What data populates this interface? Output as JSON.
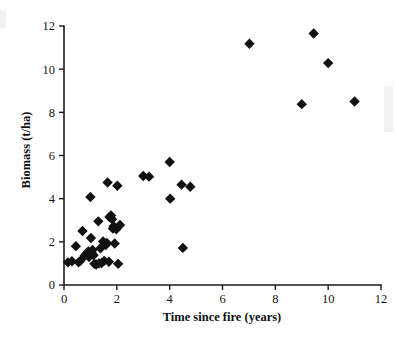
{
  "chart_data": {
    "type": "scatter",
    "title": "",
    "xlabel": "Time since fire (years)",
    "ylabel": "Biomass (t/ha)",
    "xlim": [
      0,
      12
    ],
    "ylim": [
      0,
      12
    ],
    "xticks": [
      0,
      2,
      4,
      6,
      8,
      10,
      12
    ],
    "yticks": [
      0,
      2,
      4,
      6,
      8,
      10,
      12
    ],
    "xtick_labels": [
      "0",
      "2",
      "4",
      "6",
      "8",
      "10",
      "12"
    ],
    "ytick_labels": [
      "0",
      "2",
      "4",
      "6",
      "8",
      "10",
      "12"
    ],
    "grid": false,
    "legend": false,
    "marker": "diamond",
    "marker_color": "#111111",
    "marker_size": 5.2,
    "series": [
      {
        "name": "Biomass vs time since fire",
        "points": [
          [
            0.15,
            1.05
          ],
          [
            0.3,
            1.1
          ],
          [
            0.45,
            1.8
          ],
          [
            0.55,
            1.05
          ],
          [
            0.62,
            1.12
          ],
          [
            0.7,
            2.5
          ],
          [
            0.78,
            1.35
          ],
          [
            0.85,
            1.45
          ],
          [
            0.92,
            1.55
          ],
          [
            0.95,
            1.3
          ],
          [
            1.0,
            4.08
          ],
          [
            1.02,
            2.18
          ],
          [
            1.05,
            1.48
          ],
          [
            1.08,
            1.62
          ],
          [
            1.12,
            1.38
          ],
          [
            1.15,
            0.98
          ],
          [
            1.22,
            0.95
          ],
          [
            1.3,
            2.95
          ],
          [
            1.32,
            1.0
          ],
          [
            1.38,
            1.7
          ],
          [
            1.42,
            1.02
          ],
          [
            1.48,
            2.02
          ],
          [
            1.52,
            1.12
          ],
          [
            1.58,
            1.85
          ],
          [
            1.62,
            1.95
          ],
          [
            1.65,
            4.75
          ],
          [
            1.7,
            1.08
          ],
          [
            1.72,
            3.15
          ],
          [
            1.78,
            3.22
          ],
          [
            1.82,
            3.05
          ],
          [
            1.85,
            2.62
          ],
          [
            1.88,
            2.72
          ],
          [
            1.92,
            1.92
          ],
          [
            1.98,
            2.58
          ],
          [
            2.02,
            4.6
          ],
          [
            2.05,
            0.98
          ],
          [
            2.12,
            2.78
          ],
          [
            3.0,
            5.05
          ],
          [
            3.22,
            5.02
          ],
          [
            4.0,
            5.7
          ],
          [
            4.02,
            4.0
          ],
          [
            4.45,
            4.65
          ],
          [
            4.5,
            1.72
          ],
          [
            4.78,
            4.55
          ],
          [
            7.02,
            11.18
          ],
          [
            9.0,
            8.38
          ],
          [
            9.45,
            11.65
          ],
          [
            10.0,
            10.28
          ],
          [
            11.0,
            8.5
          ]
        ]
      }
    ]
  },
  "layout": {
    "plot_left_px": 64,
    "plot_right_px": 381,
    "plot_top_px": 26,
    "plot_bottom_px": 285
  }
}
